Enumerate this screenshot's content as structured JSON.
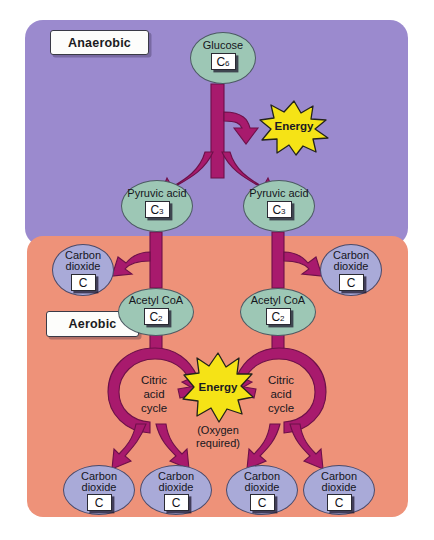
{
  "diagram": {
    "colors": {
      "anaerobic_panel": "#9b8ace",
      "aerobic_panel": "#ee9279",
      "arrow": "#a81a6d",
      "energy_burst": "#f5e316",
      "molecule_oval_green": "#9dc7b5",
      "molecule_oval_blue": "#a9aad8",
      "label_box": "#fdfdfb"
    }
  },
  "stages": {
    "anaerobic_label": "Anaerobic",
    "aerobic_label": "Aerobic"
  },
  "molecules": {
    "glucose": {
      "name": "Glucose",
      "formula_element": "C",
      "formula_sub": "6"
    },
    "pyruvic_left": {
      "name": "Pyruvic acid",
      "formula_element": "C",
      "formula_sub": "3"
    },
    "pyruvic_right": {
      "name": "Pyruvic acid",
      "formula_element": "C",
      "formula_sub": "3"
    },
    "acetyl_left": {
      "name": "Acetyl CoA",
      "formula_element": "C",
      "formula_sub": "2"
    },
    "acetyl_right": {
      "name": "Acetyl CoA",
      "formula_element": "C",
      "formula_sub": "2"
    },
    "co2": {
      "name_line1": "Carbon",
      "name_line2": "dioxide",
      "formula_element": "C"
    }
  },
  "carbon_dioxide_outputs": [
    {
      "id": "co2-upper-left",
      "name_line1": "Carbon",
      "name_line2": "dioxide",
      "formula_element": "C"
    },
    {
      "id": "co2-upper-right",
      "name_line1": "Carbon",
      "name_line2": "dioxide",
      "formula_element": "C"
    },
    {
      "id": "co2-bottom-1",
      "name_line1": "Carbon",
      "name_line2": "dioxide",
      "formula_element": "C"
    },
    {
      "id": "co2-bottom-2",
      "name_line1": "Carbon",
      "name_line2": "dioxide",
      "formula_element": "C"
    },
    {
      "id": "co2-bottom-3",
      "name_line1": "Carbon",
      "name_line2": "dioxide",
      "formula_element": "C"
    },
    {
      "id": "co2-bottom-4",
      "name_line1": "Carbon",
      "name_line2": "dioxide",
      "formula_element": "C"
    }
  ],
  "cycles": {
    "left": {
      "line1": "Citric",
      "line2": "acid",
      "line3": "cycle"
    },
    "right": {
      "line1": "Citric",
      "line2": "acid",
      "line3": "cycle"
    }
  },
  "energy": {
    "anaerobic_burst_label": "Energy",
    "aerobic_burst_label": "Energy",
    "oxygen_note_line1": "(Oxygen",
    "oxygen_note_line2": "required)"
  }
}
